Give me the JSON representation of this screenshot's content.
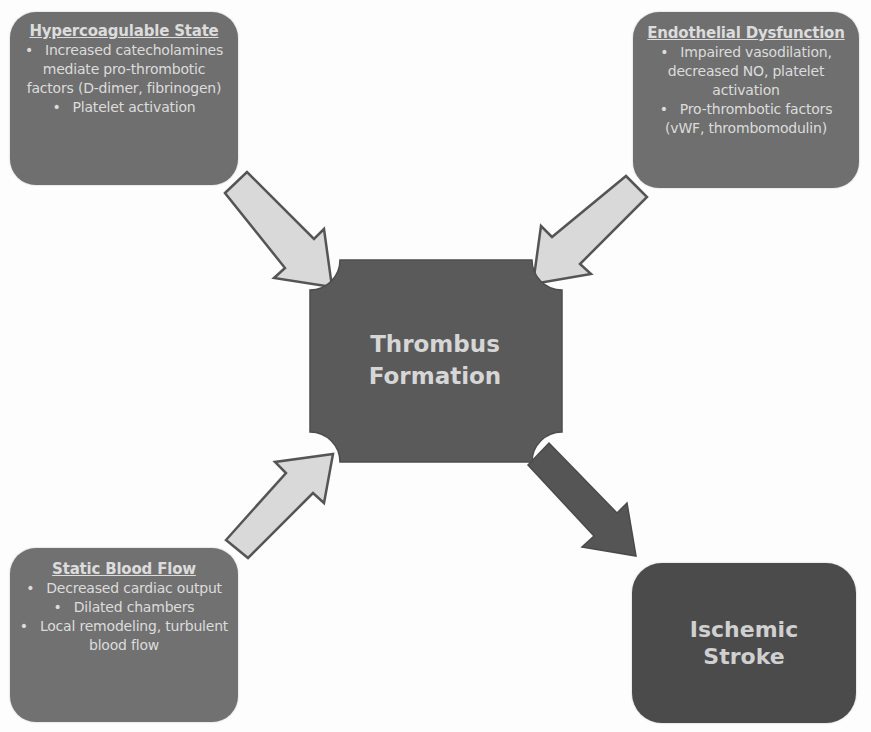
{
  "diagram": {
    "colors": {
      "cause_box": "#6f6f6f",
      "center": "#5a5a5a",
      "outcome_box": "#4b4b4b",
      "arrow_fill": "#d9d9d9",
      "arrow_outline": "#555555",
      "outcome_arrow": "#555555",
      "text": "#dcdcdc"
    },
    "causes": [
      {
        "title": "Hypercoagulable State",
        "bullets": [
          "Increased catecholamines mediate pro-thrombotic factors (D-dimer, fibrinogen)",
          "Platelet activation"
        ]
      },
      {
        "title": "Endothelial Dysfunction",
        "bullets": [
          "Impaired vasodilation, decreased NO, platelet activation",
          "Pro-thrombotic factors (vWF, thrombomodulin)"
        ]
      },
      {
        "title": "Static Blood Flow",
        "bullets": [
          "Decreased cardiac output",
          "Dilated chambers",
          "Local remodeling, turbulent blood flow"
        ]
      }
    ],
    "center": {
      "line1": "Thrombus",
      "line2": "Formation"
    },
    "outcome": {
      "line1": "Ischemic",
      "line2": "Stroke"
    },
    "edges": [
      {
        "from": "Hypercoagulable State",
        "to": "Thrombus Formation"
      },
      {
        "from": "Endothelial Dysfunction",
        "to": "Thrombus Formation"
      },
      {
        "from": "Static Blood Flow",
        "to": "Thrombus Formation"
      },
      {
        "from": "Thrombus Formation",
        "to": "Ischemic Stroke"
      }
    ]
  }
}
